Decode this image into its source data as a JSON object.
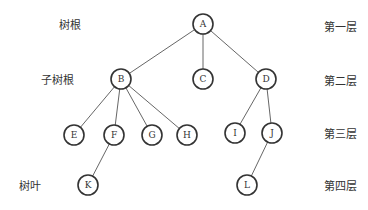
{
  "diagram": {
    "type": "tree",
    "colors": {
      "stroke": "#333333",
      "edge": "#555555",
      "text": "#333333",
      "background": "#ffffff"
    },
    "node_radius": 10,
    "nodes": [
      {
        "id": "A",
        "label": "A",
        "x": 203,
        "y": 24
      },
      {
        "id": "B",
        "label": "B",
        "x": 121,
        "y": 79
      },
      {
        "id": "C",
        "label": "C",
        "x": 203,
        "y": 79
      },
      {
        "id": "D",
        "label": "D",
        "x": 266,
        "y": 79
      },
      {
        "id": "E",
        "label": "E",
        "x": 74,
        "y": 135
      },
      {
        "id": "F",
        "label": "F",
        "x": 114,
        "y": 135
      },
      {
        "id": "G",
        "label": "G",
        "x": 152,
        "y": 135
      },
      {
        "id": "H",
        "label": "H",
        "x": 187,
        "y": 135
      },
      {
        "id": "I",
        "label": "I",
        "x": 235,
        "y": 133
      },
      {
        "id": "J",
        "label": "J",
        "x": 272,
        "y": 133
      },
      {
        "id": "K",
        "label": "K",
        "x": 88,
        "y": 185
      },
      {
        "id": "L",
        "label": "L",
        "x": 247,
        "y": 185
      }
    ],
    "edges": [
      [
        "A",
        "B"
      ],
      [
        "A",
        "C"
      ],
      [
        "A",
        "D"
      ],
      [
        "B",
        "E"
      ],
      [
        "B",
        "F"
      ],
      [
        "B",
        "G"
      ],
      [
        "B",
        "H"
      ],
      [
        "D",
        "I"
      ],
      [
        "D",
        "J"
      ],
      [
        "F",
        "K"
      ],
      [
        "J",
        "L"
      ]
    ],
    "left_labels": [
      {
        "text": "树根",
        "x": 70,
        "y": 24
      },
      {
        "text": "子树根",
        "x": 57,
        "y": 79
      },
      {
        "text": "树叶",
        "x": 30,
        "y": 185
      }
    ],
    "level_labels": [
      {
        "text": "第一层",
        "x": 340,
        "y": 26
      },
      {
        "text": "第二层",
        "x": 340,
        "y": 80
      },
      {
        "text": "第三层",
        "x": 340,
        "y": 133
      },
      {
        "text": "第四层",
        "x": 340,
        "y": 185
      }
    ]
  }
}
